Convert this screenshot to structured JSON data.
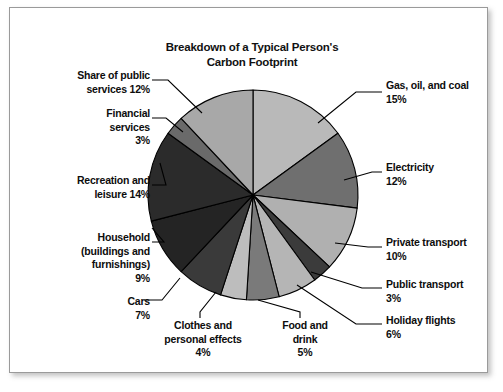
{
  "chart_data": {
    "type": "pie",
    "title": "Breakdown of a Typical Person's Carbon Footprint",
    "title_line1": "Breakdown of a Typical Person's",
    "title_line2": "Carbon Footprint",
    "unit": "%",
    "total": 100,
    "start_angle": 0,
    "direction": "clockwise",
    "legend": "none (direct leader-line labels)",
    "grid": false,
    "categories": [
      "Gas, oil, and coal",
      "Electricity",
      "Private transport",
      "Public transport",
      "Holiday flights",
      "Food and drink",
      "Clothes and personal effects",
      "Cars",
      "Household (buildings and furnishings)",
      "Recreation and leisure",
      "Financial services",
      "Share of public services"
    ],
    "values": [
      15,
      12,
      10,
      3,
      6,
      5,
      4,
      7,
      9,
      14,
      3,
      12
    ],
    "colors": [
      "#b9b9b9",
      "#6f6f6f",
      "#b0b0b0",
      "#3b3b3b",
      "#b5b5b5",
      "#7a7a7a",
      "#bdbdbd",
      "#3a3a3a",
      "#242424",
      "#2b2b2b",
      "#6a6a6a",
      "#a8a8a8"
    ],
    "slices": [
      {
        "label": "Gas, oil, and coal",
        "value": 15,
        "color": "#b9b9b9"
      },
      {
        "label": "Electricity",
        "value": 12,
        "color": "#6f6f6f"
      },
      {
        "label": "Private transport",
        "value": 10,
        "color": "#b0b0b0"
      },
      {
        "label": "Public transport",
        "value": 3,
        "color": "#3b3b3b"
      },
      {
        "label": "Holiday flights",
        "value": 6,
        "color": "#b5b5b5"
      },
      {
        "label": "Food and drink",
        "value": 5,
        "color": "#7a7a7a"
      },
      {
        "label": "Clothes and personal effects",
        "value": 4,
        "color": "#bdbdbd"
      },
      {
        "label": "Cars",
        "value": 7,
        "color": "#3a3a3a"
      },
      {
        "label": "Household (buildings and furnishings)",
        "value": 9,
        "color": "#242424"
      },
      {
        "label": "Recreation and leisure",
        "value": 14,
        "color": "#2b2b2b"
      },
      {
        "label": "Financial services",
        "value": 3,
        "color": "#6a6a6a"
      },
      {
        "label": "Share of public services",
        "value": 12,
        "color": "#a8a8a8"
      }
    ]
  },
  "labels": {
    "gas": "Gas, oil, and coal\n15%",
    "electricity": "Electricity\n12%",
    "private_transport": "Private transport\n10%",
    "public_transport": "Public transport\n3%",
    "holiday_flights": "Holiday flights\n6%",
    "share_public_services": "Share of public\nservices 12%",
    "financial_services": "Financial\nservices\n3%",
    "recreation_leisure": "Recreation and\nleisure 14%",
    "household": "Household\n(buildings and\nfurnishings)\n9%",
    "cars": "Cars\n7%",
    "clothes": "Clothes and\npersonal effects\n4%",
    "food_drink": "Food and\ndrink\n5%"
  },
  "style": {
    "slice_outline": "#000000",
    "background": "#ffffff",
    "frame_border": "#9a9a9a",
    "text_color": "#0d0d0d"
  }
}
